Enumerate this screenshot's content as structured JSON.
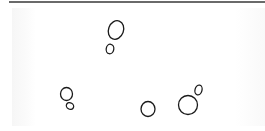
{
  "figure": {
    "colors": {
      "stroke": "#1a1a1a",
      "rule": "#6a6a6a",
      "background": "#ffffff"
    },
    "cells": [
      {
        "name": "budding-cell-top",
        "mother": {
          "cx": 116,
          "cy": 30,
          "rx": 7.5,
          "ry": 9.5,
          "rot": 20
        },
        "bud": {
          "cx": 110,
          "cy": 49,
          "rx": 3.8,
          "ry": 4.8,
          "rot": 10
        }
      },
      {
        "name": "budding-cell-bottom-left",
        "mother": {
          "cx": 66.5,
          "cy": 94,
          "rx": 6,
          "ry": 6.5,
          "rot": 0
        },
        "bud": {
          "cx": 70,
          "cy": 106,
          "rx": 3.8,
          "ry": 3.2,
          "rot": 30
        }
      },
      {
        "name": "single-cell-bottom-middle",
        "mother": {
          "cx": 148,
          "cy": 109,
          "rx": 7,
          "ry": 7.5,
          "rot": 0
        },
        "bud": null
      },
      {
        "name": "budding-cell-bottom-right",
        "mother": {
          "cx": 188,
          "cy": 105,
          "rx": 9.5,
          "ry": 9.5,
          "rot": 0
        },
        "bud": {
          "cx": 198.5,
          "cy": 90,
          "rx": 3.5,
          "ry": 5,
          "rot": 15
        }
      }
    ]
  }
}
